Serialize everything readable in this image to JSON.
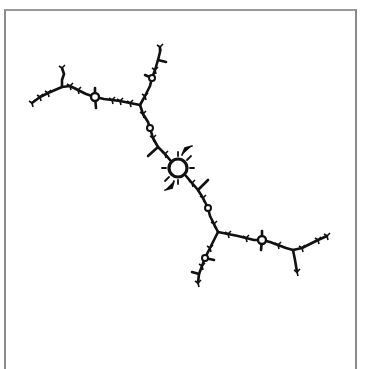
{
  "figure": {
    "stroke_color": "#111111",
    "frame_color": "#8a8a8a",
    "background": "#ffffff",
    "center_ring": {
      "cx": 178,
      "cy": 168,
      "r": 9
    },
    "rings": [
      {
        "cx": 95,
        "cy": 97,
        "r": 4
      },
      {
        "cx": 262,
        "cy": 240,
        "r": 4
      },
      {
        "cx": 152,
        "cy": 78,
        "r": 3
      },
      {
        "cx": 205,
        "cy": 258,
        "r": 3
      },
      {
        "cx": 150,
        "cy": 128,
        "r": 3
      },
      {
        "cx": 208,
        "cy": 208,
        "r": 3
      }
    ]
  }
}
